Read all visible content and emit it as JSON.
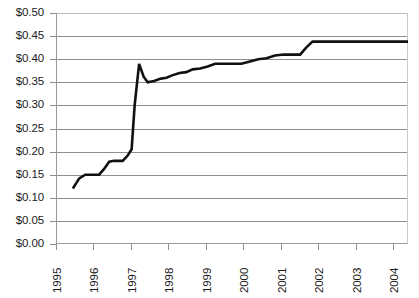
{
  "chart_data": {
    "type": "line",
    "title": "",
    "xlabel": "",
    "ylabel": "",
    "ylim": [
      0.0,
      0.5
    ],
    "xlim": [
      1995,
      2004.4
    ],
    "grid": true,
    "legend": false,
    "y_tick_labels": [
      "$0.50",
      "$0.45",
      "$0.40",
      "$0.35",
      "$0.30",
      "$0.25",
      "$0.20",
      "$0.15",
      "$0.10",
      "$0.05",
      "$0.00"
    ],
    "y_tick_values": [
      0.5,
      0.45,
      0.4,
      0.35,
      0.3,
      0.25,
      0.2,
      0.15,
      0.1,
      0.05,
      0.0
    ],
    "x_tick_labels": [
      "1995",
      "1996",
      "1997",
      "1998",
      "1999",
      "2000",
      "2001",
      "2002",
      "2003",
      "2004"
    ],
    "x_tick_values": [
      1995,
      1996,
      1997,
      1998,
      1999,
      2000,
      2001,
      2002,
      2003,
      2004
    ],
    "series": [
      {
        "name": "Price",
        "color": "#111111",
        "x": [
          1995.45,
          1995.62,
          1995.78,
          1996.15,
          1996.28,
          1996.42,
          1996.55,
          1996.78,
          1996.92,
          1997.02,
          1997.1,
          1997.22,
          1997.34,
          1997.45,
          1997.62,
          1997.8,
          1997.95,
          1998.1,
          1998.3,
          1998.48,
          1998.65,
          1998.85,
          1999.05,
          1999.25,
          1999.5,
          1999.72,
          1999.95,
          2000.18,
          2000.4,
          2000.62,
          2000.85,
          2001.08,
          2001.3,
          2001.52,
          2001.68,
          2001.85,
          2002.2,
          2003.0,
          2004.0,
          2004.4
        ],
        "y": [
          0.12,
          0.142,
          0.15,
          0.15,
          0.162,
          0.178,
          0.18,
          0.18,
          0.192,
          0.205,
          0.3,
          0.39,
          0.362,
          0.35,
          0.353,
          0.358,
          0.36,
          0.365,
          0.37,
          0.372,
          0.378,
          0.38,
          0.384,
          0.39,
          0.39,
          0.39,
          0.39,
          0.395,
          0.4,
          0.402,
          0.408,
          0.41,
          0.41,
          0.41,
          0.425,
          0.438,
          0.438,
          0.438,
          0.438,
          0.438
        ]
      }
    ]
  },
  "axis_style": {
    "gridline_color": "#8e8e8e",
    "axis_color": "#9a9a9a",
    "line_color": "#111111",
    "background": "#ffffff"
  },
  "title_remnant": ""
}
